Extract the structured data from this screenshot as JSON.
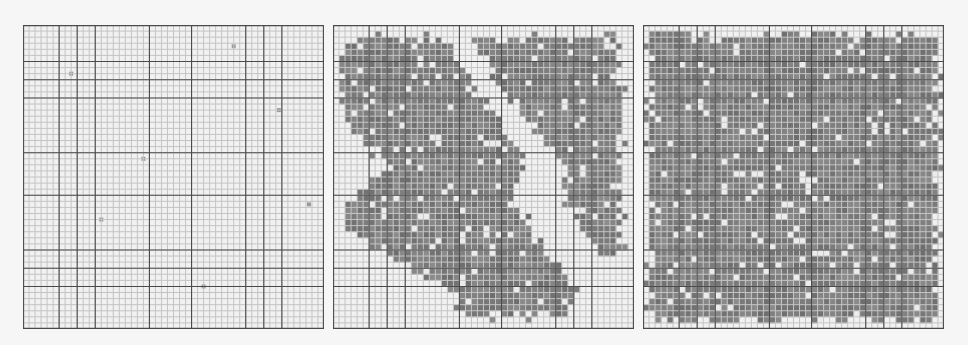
{
  "figure": {
    "panel_count": 3,
    "grid_cells": 50,
    "major_line_cells": [
      0,
      6,
      9,
      12,
      21,
      28,
      37,
      40,
      43,
      50
    ],
    "colors": {
      "background": "#f1f1f1",
      "minor_grid": "#c4c4c4",
      "major_grid": "#4a4a4a",
      "occupied_fill": "#7b7b7b",
      "empty_marker": "#ececec"
    },
    "panels": [
      {
        "id": "panel-1",
        "description": "empty grid with a few sparse occupied cells",
        "occupied_fraction": 0.0,
        "sparse_dots": [
          [
            0.16,
            0.16
          ],
          [
            0.7,
            0.07
          ],
          [
            0.85,
            0.28
          ],
          [
            0.4,
            0.44
          ],
          [
            0.26,
            0.64
          ],
          [
            0.95,
            0.59
          ],
          [
            0.6,
            0.86
          ]
        ],
        "regions": []
      },
      {
        "id": "panel-2",
        "description": "two diagonal occupied bands forming chevron pattern",
        "regions": [
          [
            [
              0.04,
              0.04
            ],
            [
              0.36,
              0.04
            ],
            [
              0.44,
              0.16
            ],
            [
              0.54,
              0.3
            ],
            [
              0.64,
              0.42
            ],
            [
              0.62,
              0.5
            ],
            [
              0.6,
              0.58
            ],
            [
              0.68,
              0.7
            ],
            [
              0.76,
              0.8
            ],
            [
              0.82,
              0.88
            ],
            [
              0.78,
              0.96
            ],
            [
              0.42,
              0.96
            ],
            [
              0.4,
              0.88
            ],
            [
              0.3,
              0.82
            ],
            [
              0.18,
              0.76
            ],
            [
              0.06,
              0.68
            ],
            [
              0.04,
              0.58
            ],
            [
              0.1,
              0.54
            ],
            [
              0.18,
              0.48
            ],
            [
              0.12,
              0.4
            ],
            [
              0.04,
              0.34
            ]
          ],
          [
            [
              0.46,
              0.04
            ],
            [
              0.95,
              0.04
            ],
            [
              0.96,
              0.2
            ],
            [
              0.96,
              0.6
            ],
            [
              0.96,
              0.78
            ],
            [
              0.9,
              0.76
            ],
            [
              0.82,
              0.66
            ],
            [
              0.76,
              0.54
            ],
            [
              0.78,
              0.46
            ],
            [
              0.7,
              0.38
            ],
            [
              0.62,
              0.28
            ],
            [
              0.54,
              0.18
            ]
          ]
        ]
      },
      {
        "id": "panel-3",
        "description": "fully occupied grid with scattered empty cells",
        "regions": [
          [
            [
              0.02,
              0.03
            ],
            [
              0.98,
              0.03
            ],
            [
              0.98,
              0.97
            ],
            [
              0.02,
              0.97
            ]
          ]
        ]
      }
    ]
  }
}
